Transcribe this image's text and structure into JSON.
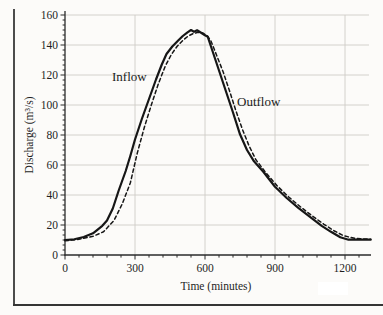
{
  "figure": {
    "kind": "scanned textbook figure",
    "background_color": "#fcfbf9",
    "border_color": "#4c4c4c",
    "ink_color": "#1b1b1b",
    "grid_color": "#cfccc6"
  },
  "chart_data": {
    "type": "line",
    "title": "",
    "xlabel": "Time (minutes)",
    "ylabel": "Discharge (m³/s)",
    "xlim": [
      0,
      1310
    ],
    "ylim": [
      0,
      160
    ],
    "x_major_ticks": [
      0,
      300,
      600,
      900,
      1200
    ],
    "x_minor_step": 60,
    "y_major_step": 20,
    "y_minor_divisions": 6,
    "grid": {
      "horizontal": true,
      "vertical_at_major": true,
      "position": "inside"
    },
    "legend_position": "inline-annotations",
    "series": [
      {
        "name": "Inflow",
        "style": "solid",
        "color": "#161616",
        "width": 2.2,
        "points": [
          [
            0,
            10
          ],
          [
            40,
            10.5
          ],
          [
            80,
            12
          ],
          [
            120,
            14.5
          ],
          [
            160,
            19.5
          ],
          [
            180,
            23
          ],
          [
            205,
            31
          ],
          [
            230,
            43
          ],
          [
            260,
            56
          ],
          [
            280,
            66
          ],
          [
            300,
            77
          ],
          [
            330,
            91
          ],
          [
            360,
            104
          ],
          [
            390,
            117
          ],
          [
            415,
            127
          ],
          [
            435,
            134
          ],
          [
            460,
            139
          ],
          [
            485,
            143
          ],
          [
            505,
            146
          ],
          [
            525,
            148.5
          ],
          [
            540,
            150
          ],
          [
            553,
            148.8
          ],
          [
            566,
            149.8
          ],
          [
            585,
            148
          ],
          [
            600,
            146.5
          ],
          [
            612,
            145.5
          ],
          [
            630,
            137
          ],
          [
            660,
            123
          ],
          [
            690,
            109
          ],
          [
            720,
            95
          ],
          [
            750,
            80.5
          ],
          [
            780,
            70
          ],
          [
            810,
            62.5
          ],
          [
            850,
            55.5
          ],
          [
            900,
            45.5
          ],
          [
            950,
            38
          ],
          [
            1000,
            31.5
          ],
          [
            1050,
            25.5
          ],
          [
            1100,
            19.5
          ],
          [
            1140,
            15.5
          ],
          [
            1180,
            11.8
          ],
          [
            1215,
            10.2
          ],
          [
            1310,
            10.2
          ]
        ]
      },
      {
        "name": "Outflow",
        "style": "dashed",
        "color": "#161616",
        "width": 1.5,
        "dash": "3.5 2.8",
        "points": [
          [
            0,
            9.5
          ],
          [
            60,
            10.5
          ],
          [
            120,
            12.5
          ],
          [
            165,
            15.5
          ],
          [
            210,
            23
          ],
          [
            245,
            34
          ],
          [
            280,
            48
          ],
          [
            310,
            68
          ],
          [
            340,
            85
          ],
          [
            370,
            100
          ],
          [
            400,
            114
          ],
          [
            430,
            126
          ],
          [
            455,
            133.5
          ],
          [
            480,
            139
          ],
          [
            505,
            143
          ],
          [
            528,
            146
          ],
          [
            548,
            147.5
          ],
          [
            570,
            148.5
          ],
          [
            590,
            148
          ],
          [
            610,
            146
          ],
          [
            625,
            143
          ],
          [
            650,
            133
          ],
          [
            678,
            122
          ],
          [
            705,
            109.5
          ],
          [
            733,
            96
          ],
          [
            760,
            84
          ],
          [
            788,
            73
          ],
          [
            818,
            63.5
          ],
          [
            860,
            55
          ],
          [
            910,
            46
          ],
          [
            960,
            38.5
          ],
          [
            1010,
            32
          ],
          [
            1060,
            26
          ],
          [
            1110,
            20.5
          ],
          [
            1155,
            16
          ],
          [
            1195,
            12.8
          ],
          [
            1245,
            11
          ],
          [
            1310,
            10.5
          ]
        ]
      }
    ],
    "annotations": [
      {
        "text": "Inflow",
        "t": 206,
        "q": 117
      },
      {
        "text": "Outflow",
        "t": 741,
        "q": 99
      }
    ]
  }
}
